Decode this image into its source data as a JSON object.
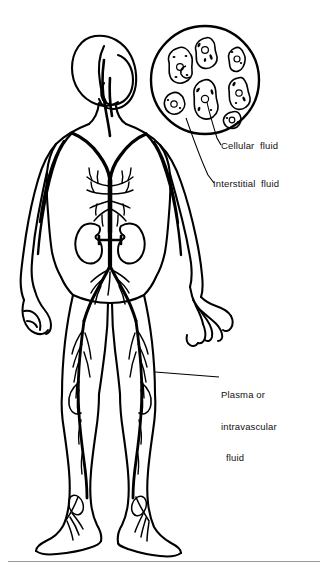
{
  "figure": {
    "background_color": "#ffffff",
    "ink_color": "#000000",
    "divider_color": "#9a9a9a"
  },
  "labels": {
    "cellular": "Cellular  fluid",
    "interstitial": "Interstitial  fluid",
    "plasma_line1": "Plasma or",
    "plasma_line2": "intravascular",
    "plasma_line3": "fluid"
  },
  "inset": {
    "name": "magnified-tissue-circle",
    "description": "circular magnification showing amoeboid cells separated by interstitial space",
    "cell_count": 8,
    "center_x": 205,
    "center_y": 80,
    "radius": 54
  },
  "anatomy": {
    "parts": [
      "head",
      "neck",
      "torso",
      "left-arm",
      "right-arm",
      "left-hand",
      "right-hand",
      "left-kidney",
      "right-kidney",
      "aorta",
      "left-leg",
      "right-leg",
      "left-foot",
      "right-foot"
    ]
  },
  "leaders": {
    "cellular_from": "cell-interior",
    "interstitial_from": "space-between-cells",
    "plasma_from": "right-thigh-vessel"
  }
}
